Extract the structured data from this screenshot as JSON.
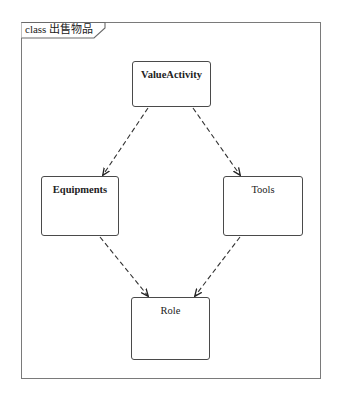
{
  "diagram": {
    "type": "uml-class-diagram",
    "frame": {
      "keyword": "class",
      "name": "出售物品",
      "label": "class 出售物品"
    },
    "classes": [
      {
        "id": "ValueActivity",
        "name": "ValueActivity",
        "bold": true,
        "x": 132,
        "y": 61,
        "w": 79,
        "h": 46
      },
      {
        "id": "Equipments",
        "name": "Equipments",
        "bold": true,
        "x": 41,
        "y": 176,
        "w": 78,
        "h": 60
      },
      {
        "id": "Tools",
        "name": "Tools",
        "bold": false,
        "x": 223,
        "y": 176,
        "w": 80,
        "h": 60
      },
      {
        "id": "Role",
        "name": "Role",
        "bold": false,
        "x": 131,
        "y": 297,
        "w": 79,
        "h": 63
      }
    ],
    "relationships": [
      {
        "type": "dependency",
        "from": "ValueActivity",
        "to": "Equipments",
        "style": "dashed-arrow"
      },
      {
        "type": "dependency",
        "from": "ValueActivity",
        "to": "Tools",
        "style": "dashed-arrow"
      },
      {
        "type": "dependency",
        "from": "Equipments",
        "to": "Role",
        "style": "dashed-arrow"
      },
      {
        "type": "dependency",
        "from": "Tools",
        "to": "Role",
        "style": "dashed-arrow"
      }
    ],
    "colors": {
      "frame": "#7a7a7a",
      "box_border": "#4a4a4a",
      "arrow": "#333333",
      "text": "#222222",
      "background": "#ffffff"
    }
  }
}
